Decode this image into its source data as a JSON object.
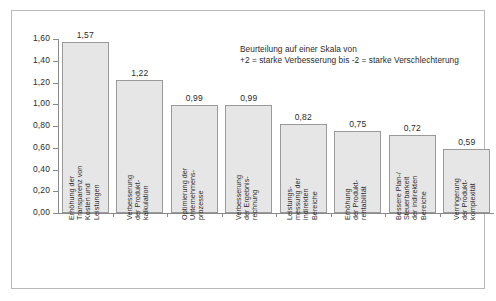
{
  "chart_data": {
    "type": "bar",
    "title": "",
    "subtitle": "",
    "xlabel": "",
    "ylabel": "",
    "ylim": [
      0.0,
      1.6
    ],
    "grid": false,
    "legend_position": "none",
    "decimal_separator": ",",
    "categories": [
      "Erhöhung der Transparenz von Kosten und Leistungen",
      "Verbesserung der Produkt-kalkulation",
      "Optimierung der Unternehmens-prozesse",
      "Verbesserung der Ergebnis-rechnung",
      "Leistungs-messung der indirekten Bereiche",
      "Erhöhung der Produkt-rentabilität",
      "Bessere Plan-/ Steuerbarkeit der indirekten Bereiche",
      "Verringerung der Produkt-komplexität"
    ],
    "category_lines": [
      [
        "Erhöhung der",
        "Transparenz von",
        "Kosten und",
        "Leistungen"
      ],
      [
        "Verbesserung",
        "der Produkt-",
        "kalkulation"
      ],
      [
        "Optimierung der",
        "Unternehmens-",
        "prozesse"
      ],
      [
        "Verbesserung",
        "der Ergebnis-",
        "rechnung"
      ],
      [
        "Leistungs-",
        "messung der",
        "indirekten",
        "Bereiche"
      ],
      [
        "Erhöhung",
        "der Produkt-",
        "rentabilität"
      ],
      [
        "Bessere Plan-/",
        "Steuerbarkeit",
        "der indirekten",
        "Bereiche"
      ],
      [
        "Verringerung",
        "der Produkt-",
        "komplexität"
      ]
    ],
    "values": [
      1.57,
      1.22,
      0.99,
      0.99,
      0.82,
      0.75,
      0.72,
      0.59
    ],
    "value_labels": [
      "1,57",
      "1,22",
      "0,99",
      "0,99",
      "0,82",
      "0,75",
      "0,72",
      "0,59"
    ],
    "ytick_values": [
      0.0,
      0.2,
      0.4,
      0.6,
      0.8,
      1.0,
      1.2,
      1.4,
      1.6
    ],
    "ytick_labels": [
      "0,00",
      "0,20",
      "0,40",
      "0,60",
      "0,80",
      "1,00",
      "1,20",
      "1,40",
      "1,60"
    ],
    "bar_fill_color": "#e6e6e6",
    "bar_border_color": "#9a9a9a",
    "axis_color": "#8a8a8a",
    "text_color": "#2b2b2b"
  },
  "annotation": {
    "line1": "Beurteilung auf einer Skala von",
    "line2": "+2 = starke Verbesserung bis -2 = starke Verschlechterung"
  }
}
